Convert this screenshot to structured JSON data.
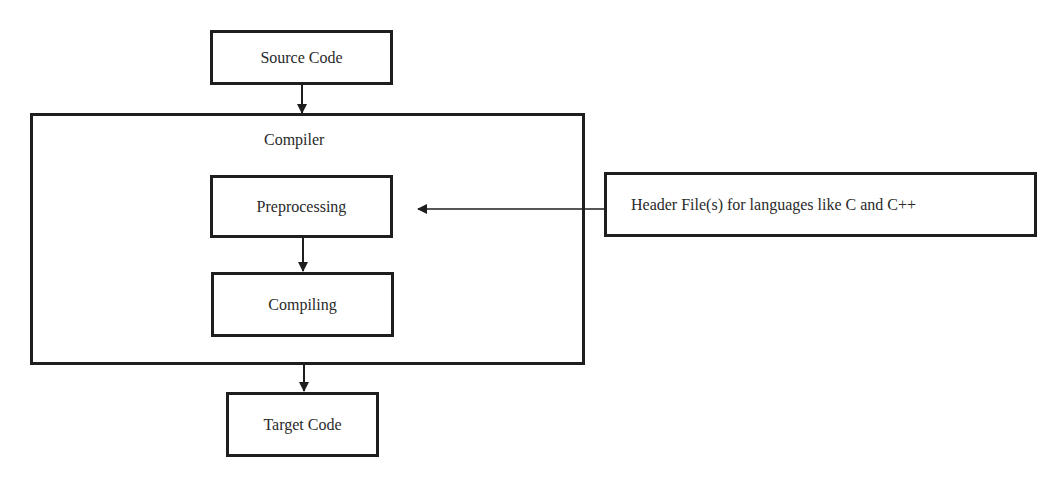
{
  "diagram": {
    "type": "flowchart",
    "nodes": {
      "source": {
        "label": "Source Code"
      },
      "compiler": {
        "label": "Compiler"
      },
      "preprocessing": {
        "label": "Preprocessing"
      },
      "compiling": {
        "label": "Compiling"
      },
      "target": {
        "label": "Target Code"
      },
      "header": {
        "label": "Header File(s) for languages like C and C++"
      }
    },
    "edges": [
      {
        "from": "Source Code",
        "to": "Compiler"
      },
      {
        "from": "Preprocessing",
        "to": "Compiling"
      },
      {
        "from": "Compiler",
        "to": "Target Code"
      },
      {
        "from": "Header File(s) for languages like C and C++",
        "to": "Preprocessing"
      }
    ],
    "colors": {
      "stroke": "#1e1e1e",
      "text": "#2a2a2a",
      "background": "#ffffff"
    }
  }
}
